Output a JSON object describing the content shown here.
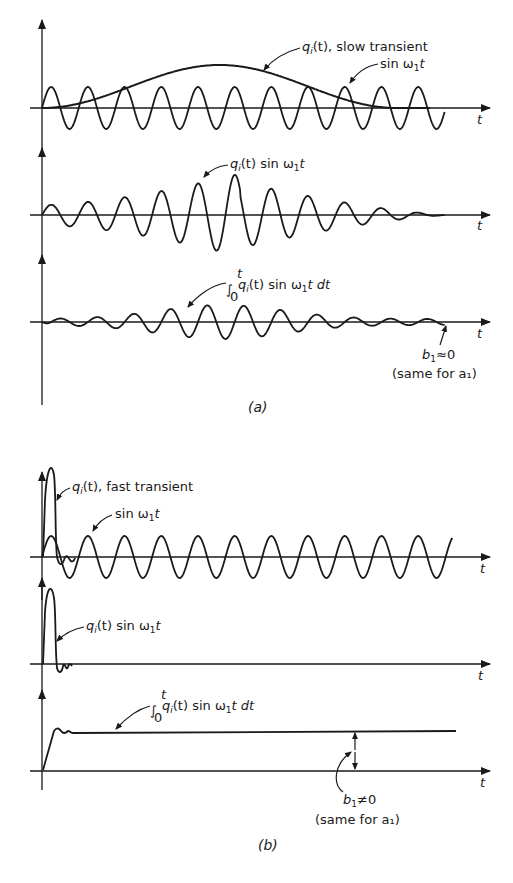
{
  "figure": {
    "panel_a": {
      "caption": "(a)",
      "plot1": {
        "curve_labels": [
          "q_i(t), slow transient",
          "sin ω₁t"
        ],
        "label_q": "q",
        "label_q_sub": "i",
        "label_q_rest": "(t), slow transient",
        "label_sin": "sin ω",
        "label_sin_sub": "1",
        "label_sin_rest": "t",
        "axis_label": "t"
      },
      "plot2": {
        "label_q": "q",
        "label_q_sub": "i",
        "label_rest": "(t) sin ω",
        "label_sub2": "1",
        "label_end": "t",
        "axis_label": "t"
      },
      "plot3": {
        "integral_sign": "∫",
        "upper_limit": "t",
        "lower_limit": "0",
        "label_q": "q",
        "label_q_sub": "i",
        "label_rest": "(t) sin ω",
        "label_sub2": "1",
        "label_end": "t dt",
        "axis_label": "t",
        "result_b": "b",
        "result_sub": "1",
        "result_rel": "≈0",
        "result_note": "(same for a₁)"
      }
    },
    "panel_b": {
      "caption": "(b)",
      "plot1": {
        "label_q": "q",
        "label_q_sub": "i",
        "label_q_rest": "(t), fast transient",
        "label_sin": "sin ω",
        "label_sin_sub": "1",
        "label_sin_rest": "t",
        "axis_label": "t"
      },
      "plot2": {
        "label_q": "q",
        "label_q_sub": "i",
        "label_rest": "(t) sin ω",
        "label_sub2": "1",
        "label_end": "t",
        "axis_label": "t"
      },
      "plot3": {
        "integral_sign": "∫",
        "upper_limit": "t",
        "lower_limit": "0",
        "label_q": "q",
        "label_q_sub": "i",
        "label_rest": "(t) sin ω",
        "label_sub2": "1",
        "label_end": "t dt",
        "axis_label": "t",
        "result_b": "b",
        "result_sub": "1",
        "result_rel": "≠0",
        "result_note": "(same for a₁)"
      }
    }
  },
  "colors": {
    "ink": "#1a1a1a",
    "background": "#ffffff"
  }
}
